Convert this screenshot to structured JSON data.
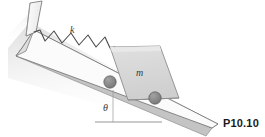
{
  "figure": {
    "id_label": "P10.10",
    "spring_label": "k",
    "mass_label": "m",
    "angle_label": "θ",
    "colors": {
      "incline_face": "#ffffff",
      "incline_edge": "#6e6e6e",
      "incline_side": "#c9c9c9",
      "shadow": "#e2e2e2",
      "block_fill": "#d6d6d6",
      "block_edge": "#8c8c8c",
      "wheel_fill": "#8a8a8a",
      "wheel_edge": "#5a5a5a",
      "spring_stroke": "#4a4a4a",
      "guide_line": "#9a9a9a",
      "text": "#3a3a3a",
      "id_text": "#1a1a1a"
    },
    "geometry": {
      "incline_angle_deg": 27,
      "spring_coil_peaks": 6,
      "wheel_count": 2
    }
  }
}
